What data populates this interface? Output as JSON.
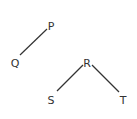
{
  "diagram": {
    "type": "tree",
    "nodes": [
      {
        "id": "P",
        "label": "P",
        "x": 51,
        "y": 27
      },
      {
        "id": "Q",
        "label": "Q",
        "x": 15,
        "y": 64
      },
      {
        "id": "R",
        "label": "R",
        "x": 87,
        "y": 64
      },
      {
        "id": "S",
        "label": "S",
        "x": 51,
        "y": 101
      },
      {
        "id": "T",
        "label": "T",
        "x": 123,
        "y": 101
      }
    ],
    "edges": [
      {
        "from": "P",
        "to": "Q"
      },
      {
        "from": "R",
        "to": "S"
      },
      {
        "from": "R",
        "to": "T"
      }
    ],
    "colors": {
      "stroke": "#333333",
      "background": "#ffffff"
    }
  }
}
